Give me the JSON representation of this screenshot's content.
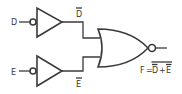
{
  "diagram": {
    "type": "logic-circuit",
    "inputs": [
      {
        "label": "D",
        "inverter_output_label": "D"
      },
      {
        "label": "E",
        "inverter_output_label": "E"
      }
    ],
    "gates": [
      {
        "type": "inverter",
        "input": "D",
        "output": "D-bar"
      },
      {
        "type": "inverter",
        "input": "E",
        "output": "E-bar"
      },
      {
        "type": "NOR",
        "inputs": [
          "D-bar",
          "E-bar"
        ],
        "output": "F"
      }
    ],
    "output": {
      "lhs": "F",
      "eq": "=",
      "term1": "D",
      "plus": "+",
      "term2": "E",
      "expression_text": "F = NOT(NOT D + NOT E)"
    },
    "colors": {
      "ink": "#3a3a3a",
      "background": "#ffffff"
    }
  }
}
